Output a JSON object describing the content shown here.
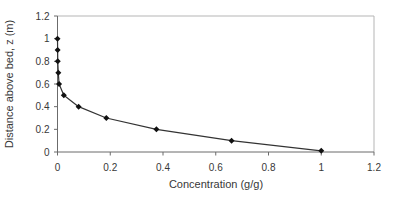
{
  "chart_data": {
    "type": "line",
    "title": "",
    "xlabel": "Concentration (g/g)",
    "ylabel": "Distance above bed, z (m)",
    "xlim": [
      0,
      1.2
    ],
    "ylim": [
      0,
      1.2
    ],
    "x_tick_values": [
      0,
      0.2,
      0.4,
      0.6,
      0.8,
      1,
      1.2
    ],
    "x_tick_labels": [
      "0",
      "0.2",
      "0.4",
      "0.6",
      "0.8",
      "1",
      "1.2"
    ],
    "y_tick_values": [
      0,
      0.2,
      0.4,
      0.6,
      0.8,
      1,
      1.2
    ],
    "y_tick_labels": [
      "0",
      "0.2",
      "0.4",
      "0.6",
      "0.8",
      "1",
      "1.2"
    ],
    "grid": false,
    "legend": false,
    "series": [
      {
        "name": "concentration-profile",
        "marker": "diamond",
        "line_color": "#333333",
        "marker_color": "#111111",
        "points": [
          {
            "x": 0.0,
            "y": 1.0
          },
          {
            "x": 0.0005,
            "y": 0.9
          },
          {
            "x": 0.001,
            "y": 0.8
          },
          {
            "x": 0.003,
            "y": 0.7
          },
          {
            "x": 0.006,
            "y": 0.6
          },
          {
            "x": 0.024,
            "y": 0.5
          },
          {
            "x": 0.08,
            "y": 0.4
          },
          {
            "x": 0.185,
            "y": 0.3
          },
          {
            "x": 0.375,
            "y": 0.2
          },
          {
            "x": 0.66,
            "y": 0.1
          },
          {
            "x": 1.0,
            "y": 0.01
          }
        ]
      }
    ],
    "colors": {
      "axis": "#6b6b6b",
      "plot_border": "#b5b5b5",
      "text": "#383838",
      "background": "#ffffff"
    }
  }
}
